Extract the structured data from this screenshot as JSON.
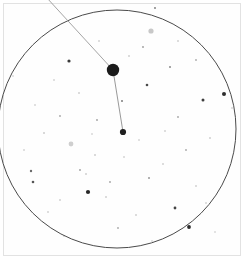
{
  "figure": {
    "title": "Finder chart field of view",
    "background_color": "#ffffff",
    "panel_color": "#fefefe",
    "frame_color": "#e2e2e2",
    "width": 245,
    "height": 260
  },
  "field_circle": {
    "label": "field-of-view circle",
    "center_x": 117,
    "center_y": 129,
    "radius": 119,
    "stroke_color": "#4a4a4a",
    "stroke_width": 1.0,
    "fill": "none"
  },
  "pointer_line": {
    "label": "pointer line to primary target",
    "x1": 47,
    "y1": -2,
    "x2": 113,
    "y2": 70,
    "stroke_color": "#9a9a9a",
    "stroke_width": 0.9
  },
  "connector_line": {
    "label": "connector between primary and secondary target",
    "x1": 113,
    "y1": 70,
    "x2": 123,
    "y2": 132,
    "stroke_color": "#8d8d8d",
    "stroke_width": 0.9
  },
  "targets": [
    {
      "name": "primary-target",
      "x": 113,
      "y": 70,
      "radius": 6.2,
      "color": "#1b1b1b"
    },
    {
      "name": "secondary-target",
      "x": 123,
      "y": 132,
      "radius": 3.1,
      "color": "#1f1f1f"
    }
  ],
  "chart_data": {
    "type": "scatter",
    "title": "Finder chart field of view",
    "subtitle": "",
    "xlabel": "",
    "ylabel": "",
    "grid": false,
    "legend": "none",
    "xlim": [
      0,
      245
    ],
    "ylim": [
      0,
      260
    ],
    "axis_note": "image pixel coordinates, y increases downward",
    "marked_objects": [
      {
        "id": "primary-target",
        "x": 113,
        "y": 70,
        "size": 12.4,
        "shade": "#1b1b1b"
      },
      {
        "id": "secondary-target",
        "x": 123,
        "y": 132,
        "size": 6.2,
        "shade": "#1f1f1f"
      }
    ],
    "field_stars": [
      {
        "x": 69,
        "y": 61,
        "r": 1.6,
        "shade": "#3a3a3a"
      },
      {
        "x": 224,
        "y": 94,
        "r": 2.0,
        "shade": "#2e2e2e"
      },
      {
        "x": 203,
        "y": 100,
        "r": 1.5,
        "shade": "#3d3d3d"
      },
      {
        "x": 88,
        "y": 192,
        "r": 2.1,
        "shade": "#272727"
      },
      {
        "x": 189,
        "y": 227,
        "r": 1.9,
        "shade": "#2b2b2b"
      },
      {
        "x": 175,
        "y": 208,
        "r": 1.4,
        "shade": "#444444"
      },
      {
        "x": 147,
        "y": 85,
        "r": 1.3,
        "shade": "#4a4a4a"
      },
      {
        "x": 151,
        "y": 31,
        "r": 2.6,
        "shade": "#c8c8c8"
      },
      {
        "x": 33,
        "y": 182,
        "r": 1.3,
        "shade": "#555555"
      },
      {
        "x": 71,
        "y": 144,
        "r": 2.4,
        "shade": "#cfcfcf"
      },
      {
        "x": 31,
        "y": 171,
        "r": 1.2,
        "shade": "#6a6a6a"
      },
      {
        "x": 122,
        "y": 101,
        "r": 1.0,
        "shade": "#7d7d7d"
      },
      {
        "x": 170,
        "y": 67,
        "r": 1.0,
        "shade": "#8a8a8a"
      },
      {
        "x": 143,
        "y": 47,
        "r": 0.9,
        "shade": "#9a9a9a"
      },
      {
        "x": 97,
        "y": 120,
        "r": 0.9,
        "shade": "#9e9e9e"
      },
      {
        "x": 60,
        "y": 116,
        "r": 0.9,
        "shade": "#a5a5a5"
      },
      {
        "x": 44,
        "y": 133,
        "r": 0.8,
        "shade": "#aaaaaa"
      },
      {
        "x": 80,
        "y": 170,
        "r": 0.9,
        "shade": "#9c9c9c"
      },
      {
        "x": 86,
        "y": 174,
        "r": 0.8,
        "shade": "#b0b0b0"
      },
      {
        "x": 95,
        "y": 155,
        "r": 0.8,
        "shade": "#aeaeae"
      },
      {
        "x": 110,
        "y": 182,
        "r": 0.9,
        "shade": "#a2a2a2"
      },
      {
        "x": 106,
        "y": 197,
        "r": 0.8,
        "shade": "#b2b2b2"
      },
      {
        "x": 60,
        "y": 200,
        "r": 0.8,
        "shade": "#b4b4b4"
      },
      {
        "x": 48,
        "y": 212,
        "r": 0.8,
        "shade": "#b6b6b6"
      },
      {
        "x": 118,
        "y": 228,
        "r": 0.9,
        "shade": "#a8a8a8"
      },
      {
        "x": 136,
        "y": 215,
        "r": 0.8,
        "shade": "#b1b1b1"
      },
      {
        "x": 149,
        "y": 178,
        "r": 1.0,
        "shade": "#999999"
      },
      {
        "x": 163,
        "y": 164,
        "r": 0.8,
        "shade": "#b3b3b3"
      },
      {
        "x": 186,
        "y": 150,
        "r": 0.9,
        "shade": "#a6a6a6"
      },
      {
        "x": 196,
        "y": 186,
        "r": 0.8,
        "shade": "#b5b5b5"
      },
      {
        "x": 206,
        "y": 203,
        "r": 0.8,
        "shade": "#b8b8b8"
      },
      {
        "x": 210,
        "y": 138,
        "r": 0.8,
        "shade": "#b0b0b0"
      },
      {
        "x": 178,
        "y": 117,
        "r": 0.9,
        "shade": "#a4a4a4"
      },
      {
        "x": 165,
        "y": 131,
        "r": 0.8,
        "shade": "#b7b7b7"
      },
      {
        "x": 196,
        "y": 60,
        "r": 0.9,
        "shade": "#a9a9a9"
      },
      {
        "x": 178,
        "y": 41,
        "r": 0.8,
        "shade": "#b4b4b4"
      },
      {
        "x": 129,
        "y": 56,
        "r": 0.8,
        "shade": "#b1b1b1"
      },
      {
        "x": 99,
        "y": 41,
        "r": 0.8,
        "shade": "#b6b6b6"
      },
      {
        "x": 79,
        "y": 93,
        "r": 0.8,
        "shade": "#b2b2b2"
      },
      {
        "x": 54,
        "y": 80,
        "r": 0.8,
        "shade": "#bbbbbb"
      },
      {
        "x": 35,
        "y": 105,
        "r": 0.8,
        "shade": "#bcbcbc"
      },
      {
        "x": 24,
        "y": 150,
        "r": 0.8,
        "shade": "#bababa"
      },
      {
        "x": 64,
        "y": 236,
        "r": 0.8,
        "shade": "#c0c0c0"
      },
      {
        "x": 152,
        "y": 241,
        "r": 0.8,
        "shade": "#c2c2c2"
      },
      {
        "x": 215,
        "y": 232,
        "r": 0.8,
        "shade": "#c1c1c1"
      },
      {
        "x": 232,
        "y": 108,
        "r": 0.8,
        "shade": "#bdbdbd"
      },
      {
        "x": 13,
        "y": 76,
        "r": 0.8,
        "shade": "#c3c3c3"
      },
      {
        "x": 155,
        "y": 8,
        "r": 0.9,
        "shade": "#777777"
      },
      {
        "x": 124,
        "y": 157,
        "r": 0.8,
        "shade": "#b9b9b9"
      },
      {
        "x": 139,
        "y": 140,
        "r": 0.8,
        "shade": "#bebebe"
      },
      {
        "x": 92,
        "y": 134,
        "r": 0.8,
        "shade": "#bfbfbf"
      }
    ]
  }
}
